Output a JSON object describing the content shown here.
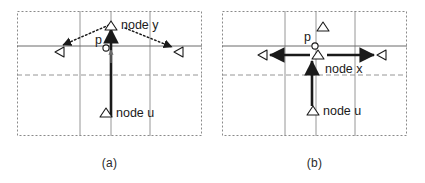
{
  "figure": {
    "panels": [
      {
        "id": "a",
        "caption": "(a)",
        "labels": {
          "node_y": "node y",
          "node_u": "node u",
          "p": "p"
        },
        "markers": {
          "node_y_icon": "triangle-up-marker",
          "node_u_icon": "triangle-up-marker",
          "left_icon": "triangle-left-marker",
          "right_icon": "triangle-left-marker",
          "p_icon": "circle-point-marker"
        },
        "arrows": [
          {
            "name": "solid-arrow-u-to-y",
            "style": "solid-bold",
            "direction": "up"
          },
          {
            "name": "dotted-arrow-y-to-left",
            "style": "dotted",
            "direction": "down-left"
          },
          {
            "name": "dotted-arrow-y-to-right",
            "style": "dotted",
            "direction": "down-right"
          },
          {
            "name": "solid-arrow-short-up",
            "style": "solid-thin",
            "direction": "up"
          }
        ]
      },
      {
        "id": "b",
        "caption": "(b)",
        "labels": {
          "node_x": "node x",
          "node_u": "node u",
          "p": "p"
        },
        "markers": {
          "top_icon": "triangle-up-marker",
          "node_x_icon": "triangle-up-marker",
          "node_u_icon": "triangle-up-marker",
          "left_icon": "triangle-left-marker",
          "right_icon": "triangle-left-marker",
          "p_icon": "circle-point-marker"
        },
        "arrows": [
          {
            "name": "solid-arrow-u-to-x",
            "style": "solid-bold",
            "direction": "up"
          },
          {
            "name": "solid-arrow-center-to-left",
            "style": "solid-bold",
            "direction": "left"
          },
          {
            "name": "solid-arrow-center-to-right",
            "style": "solid-bold",
            "direction": "right"
          }
        ]
      }
    ],
    "colors": {
      "ink": "#1a1a1a",
      "grid": "#8a8a8a",
      "border": "#8a8a8a",
      "background": "#ffffff"
    }
  }
}
